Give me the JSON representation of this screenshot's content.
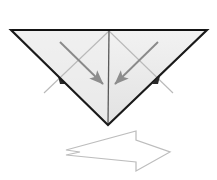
{
  "figure": {
    "title": "Origami fold step diagram",
    "background_color": "#ffffff",
    "paper_fill_color": "#e8e8e8",
    "paper_fill_color_secondary": "#f0f0f0",
    "paper_outline_color": "#1a1a1a",
    "crease_line_color": "#b9b9b9",
    "fold_arrow_color": "#8a8a8a",
    "step_arrow_outline_color": "#bdbdbd",
    "step_arrow_fill_color": "#ffffff"
  },
  "shapes": {
    "paper": {
      "name": "inverted-triangle",
      "description": "Downward pointing triangle of folded paper",
      "points": "11,30 207,30 108,125",
      "apex_top_left": [
        11,
        30
      ],
      "apex_top_right": [
        207,
        30
      ],
      "apex_bottom": [
        108,
        125
      ]
    },
    "center_crease": {
      "name": "vertical-center-crease",
      "from": [
        109,
        31
      ],
      "to": [
        108,
        124
      ]
    },
    "crease_left": {
      "name": "diagonal-crease-left",
      "from": [
        109,
        31
      ],
      "to": [
        44,
        93
      ]
    },
    "crease_right": {
      "name": "diagonal-crease-right",
      "from": [
        109,
        31
      ],
      "to": [
        173,
        93
      ]
    },
    "flap_left": {
      "name": "left-flap-edge",
      "from": [
        11,
        30
      ],
      "to": [
        62,
        80
      ]
    },
    "flap_right": {
      "name": "right-flap-edge",
      "from": [
        207,
        30
      ],
      "to": [
        156,
        80
      ]
    }
  },
  "annotations": {
    "fold_arrow_left": {
      "label": "fold-arrow-left",
      "meaning": "Fold left flap inward toward the center",
      "from": [
        60,
        42
      ],
      "to": [
        103,
        84
      ],
      "direction": "down-right"
    },
    "fold_arrow_right": {
      "label": "fold-arrow-right",
      "meaning": "Fold right flap inward toward the center",
      "from": [
        158,
        42
      ],
      "to": [
        115,
        84
      ],
      "direction": "down-left"
    },
    "step_arrow": {
      "label": "next-step-arrow",
      "meaning": "Proceed to the next step",
      "direction": "right",
      "tail_x": 66,
      "tip_x": 170,
      "center_y": 152
    }
  }
}
